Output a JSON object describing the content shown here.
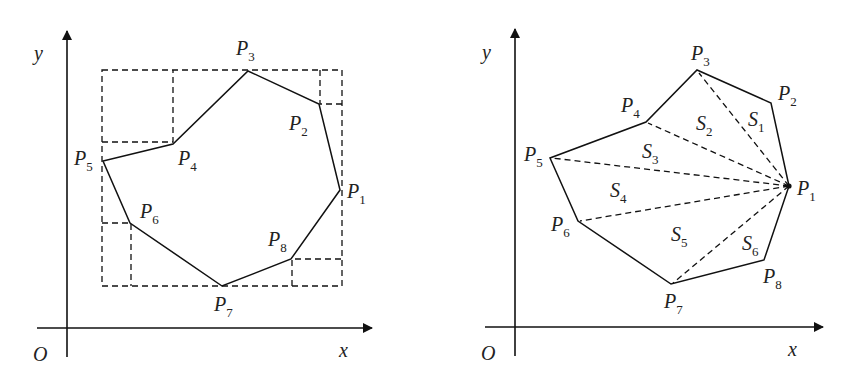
{
  "figures": [
    {
      "id": "left",
      "description": "Polygon P1..P8 enclosed in a dashed bounding rectangle with dashed corner rectangles",
      "axes": {
        "origin_label": "O",
        "x_label": "x",
        "y_label": "y"
      },
      "vertices": [
        {
          "name": "P",
          "sub": "1"
        },
        {
          "name": "P",
          "sub": "2"
        },
        {
          "name": "P",
          "sub": "3"
        },
        {
          "name": "P",
          "sub": "4"
        },
        {
          "name": "P",
          "sub": "5"
        },
        {
          "name": "P",
          "sub": "6"
        },
        {
          "name": "P",
          "sub": "7"
        },
        {
          "name": "P",
          "sub": "8"
        }
      ]
    },
    {
      "id": "right",
      "description": "Polygon P1..P8 triangulated from P1 with dashed diagonals into regions S1..S6",
      "axes": {
        "origin_label": "O",
        "x_label": "x",
        "y_label": "y"
      },
      "vertices": [
        {
          "name": "P",
          "sub": "1"
        },
        {
          "name": "P",
          "sub": "2"
        },
        {
          "name": "P",
          "sub": "3"
        },
        {
          "name": "P",
          "sub": "4"
        },
        {
          "name": "P",
          "sub": "5"
        },
        {
          "name": "P",
          "sub": "6"
        },
        {
          "name": "P",
          "sub": "7"
        },
        {
          "name": "P",
          "sub": "8"
        }
      ],
      "regions": [
        {
          "name": "S",
          "sub": "1"
        },
        {
          "name": "S",
          "sub": "2"
        },
        {
          "name": "S",
          "sub": "3"
        },
        {
          "name": "S",
          "sub": "4"
        },
        {
          "name": "S",
          "sub": "5"
        },
        {
          "name": "S",
          "sub": "6"
        }
      ]
    }
  ]
}
